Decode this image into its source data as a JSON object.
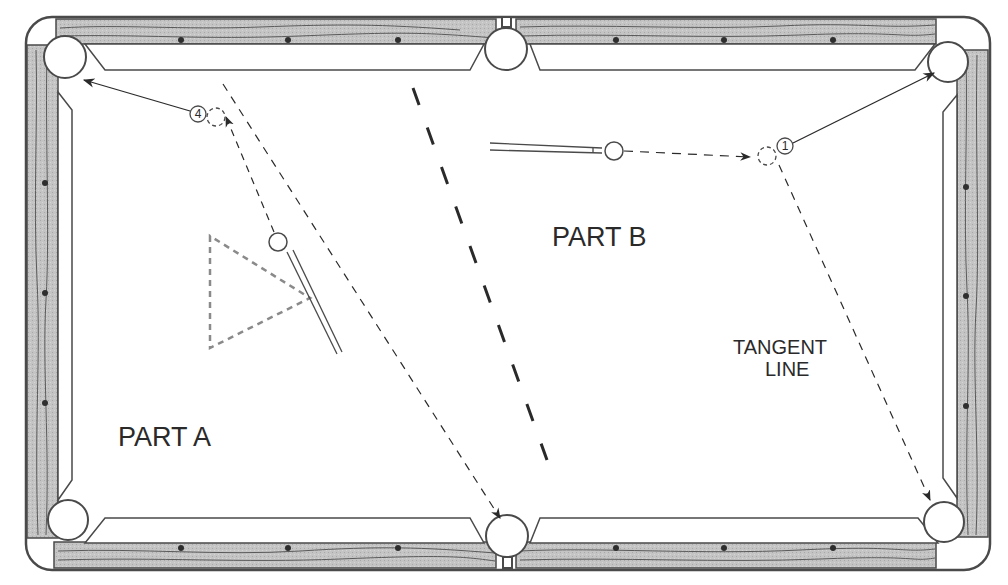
{
  "diagram": {
    "type": "billiards-table-shot-diagram",
    "colors": {
      "rail_wood": "#bdbdbd",
      "outline": "#4a4a4a",
      "felt": "#ffffff",
      "grain": "#5a5a5a",
      "diamond": "#2e2e2e",
      "rack_triangle": "#8a8a8a",
      "text": "#2a2a2a"
    },
    "labels": {
      "part_a": "PART A",
      "part_b": "PART B",
      "tangent_line_1": "TANGENT",
      "tangent_line_2": "LINE"
    },
    "balls": [
      {
        "id": "ball-4",
        "number": "4",
        "part": "A"
      },
      {
        "id": "ball-1",
        "number": "1",
        "part": "B"
      }
    ],
    "pockets": [
      "top-left",
      "top-middle",
      "top-right",
      "bottom-left",
      "bottom-middle",
      "bottom-right"
    ],
    "paths": {
      "part_a": [
        "cue ball travels up-left to contact ghost ball at object ball 4",
        "object ball 4 travels to top-left corner pocket",
        "cue ball deflects along tangent to bottom-middle side pocket"
      ],
      "part_b": [
        "cue ball travels right to contact ghost ball at object ball 1",
        "object ball 1 travels to top-right corner pocket",
        "cue ball follows tangent line to bottom-right corner pocket"
      ]
    },
    "divider": "heavy dashed line separating Part A and Part B"
  }
}
